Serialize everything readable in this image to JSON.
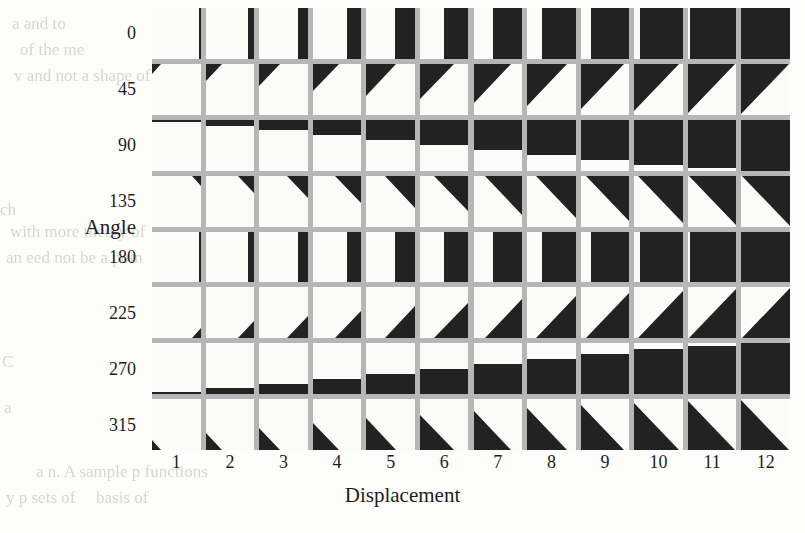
{
  "figure": {
    "type": "lattice-glyph-matrix",
    "background_color": "#fdfdfb",
    "grid_gutter_color": "#b6b6b6",
    "cell_background_color": "#fbfbf8",
    "glyph_color": "#222222"
  },
  "axes": {
    "y_title": "Angle",
    "x_title": "Displacement",
    "y_ticks": [
      "0",
      "45",
      "90",
      "135",
      "180",
      "225",
      "270",
      "315"
    ],
    "x_ticks": [
      "1",
      "2",
      "3",
      "4",
      "5",
      "6",
      "7",
      "8",
      "9",
      "10",
      "11",
      "12"
    ]
  },
  "chart_data": {
    "type": "heatmap",
    "title": "",
    "subtitle": "",
    "xlabel": "Displacement",
    "ylabel": "Angle",
    "legend": [],
    "grid": true,
    "x": [
      1,
      2,
      3,
      4,
      5,
      6,
      7,
      8,
      9,
      10,
      11,
      12
    ],
    "y": [
      0,
      45,
      90,
      135,
      180,
      225,
      270,
      315
    ],
    "fill_fraction": [
      0.04,
      0.12,
      0.2,
      0.3,
      0.4,
      0.5,
      0.6,
      0.7,
      0.79,
      0.88,
      0.95,
      1.0
    ],
    "glyph_shapes": {
      "0": "vertical-bar-right-anchored",
      "45": "triangle-top-left",
      "90": "horizontal-bar-top-anchored",
      "135": "triangle-top-right",
      "180": "vertical-bar-right-anchored",
      "225": "triangle-bottom-right",
      "270": "horizontal-bar-bottom-anchored",
      "315": "triangle-bottom-left"
    },
    "series": [
      {
        "name": "0",
        "values": [
          0.04,
          0.12,
          0.2,
          0.3,
          0.4,
          0.5,
          0.6,
          0.7,
          0.79,
          0.88,
          0.95,
          1.0
        ]
      },
      {
        "name": "45",
        "values": [
          0.04,
          0.12,
          0.2,
          0.3,
          0.4,
          0.5,
          0.6,
          0.7,
          0.79,
          0.88,
          0.95,
          1.0
        ]
      },
      {
        "name": "90",
        "values": [
          0.04,
          0.12,
          0.2,
          0.3,
          0.4,
          0.5,
          0.6,
          0.7,
          0.79,
          0.88,
          0.95,
          1.0
        ]
      },
      {
        "name": "135",
        "values": [
          0.04,
          0.12,
          0.2,
          0.3,
          0.4,
          0.5,
          0.6,
          0.7,
          0.79,
          0.88,
          0.95,
          1.0
        ]
      },
      {
        "name": "180",
        "values": [
          0.04,
          0.12,
          0.2,
          0.3,
          0.4,
          0.5,
          0.6,
          0.7,
          0.79,
          0.88,
          0.95,
          1.0
        ]
      },
      {
        "name": "225",
        "values": [
          0.04,
          0.12,
          0.2,
          0.3,
          0.4,
          0.5,
          0.6,
          0.7,
          0.79,
          0.88,
          0.95,
          1.0
        ]
      },
      {
        "name": "270",
        "values": [
          0.04,
          0.12,
          0.2,
          0.3,
          0.4,
          0.5,
          0.6,
          0.7,
          0.79,
          0.88,
          0.95,
          1.0
        ]
      },
      {
        "name": "315",
        "values": [
          0.04,
          0.12,
          0.2,
          0.3,
          0.4,
          0.5,
          0.6,
          0.7,
          0.79,
          0.88,
          0.95,
          1.0
        ]
      }
    ]
  },
  "layout": {
    "panel": {
      "left": 152,
      "top": 8,
      "width": 638,
      "height": 442
    },
    "cols": 12,
    "rows": 8,
    "gutter": 5
  },
  "bleed_text": [
    {
      "text": "a and to",
      "x": 12,
      "y": 14,
      "size": 17
    },
    {
      "text": "of the me",
      "x": 20,
      "y": 40,
      "size": 17
    },
    {
      "text": "v and not a shape of",
      "x": 14,
      "y": 66,
      "size": 17
    },
    {
      "text": "ch",
      "x": 0,
      "y": 200,
      "size": 17
    },
    {
      "text": "with more theory of",
      "x": 10,
      "y": 222,
      "size": 17
    },
    {
      "text": "an eed not be a poin",
      "x": 6,
      "y": 248,
      "size": 17
    },
    {
      "text": "C",
      "x": 2,
      "y": 352,
      "size": 17
    },
    {
      "text": "a",
      "x": 4,
      "y": 398,
      "size": 17
    },
    {
      "text": "y p sets of",
      "x": 6,
      "y": 488,
      "size": 17
    },
    {
      "text": "basis of",
      "x": 96,
      "y": 488,
      "size": 17
    },
    {
      "text": "a n. A sample p functions",
      "x": 36,
      "y": 462,
      "size": 17
    }
  ]
}
